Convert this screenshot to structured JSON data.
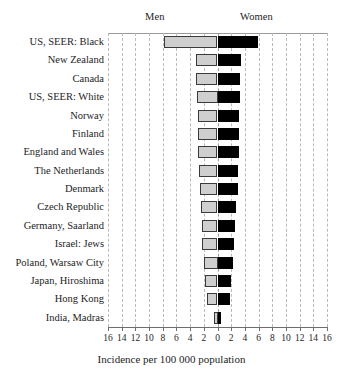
{
  "chart_data": {
    "type": "bar",
    "orientation": "horizontal",
    "style": "bidirectional-paired-bar",
    "title": "",
    "xlabel": "Incidence per 100 000 population",
    "ylabel": "",
    "xlim": [
      -16,
      16
    ],
    "xtick_step": 2,
    "xticks": [
      16,
      14,
      12,
      10,
      8,
      6,
      4,
      2,
      0,
      2,
      4,
      6,
      8,
      10,
      12,
      14,
      16
    ],
    "grid": true,
    "legend_position": "top",
    "categories": [
      "US, SEER: Black",
      "New Zealand",
      "Canada",
      "US, SEER: White",
      "Norway",
      "Finland",
      "England and Wales",
      "The Netherlands",
      "Denmark",
      "Czech Republic",
      "Germany, Saarland",
      "Israel: Jews",
      "Poland, Warsaw City",
      "Japan, Hiroshima",
      "Hong Kong",
      "India, Madras"
    ],
    "series": [
      {
        "name": "Men",
        "side": "left",
        "color": "#cfcfcf",
        "values": [
          7.8,
          3.2,
          3.1,
          3.0,
          2.9,
          2.9,
          2.8,
          2.7,
          2.6,
          2.4,
          2.3,
          2.2,
          2.0,
          1.8,
          1.6,
          0.5
        ]
      },
      {
        "name": "Women",
        "side": "right",
        "color": "#000000",
        "values": [
          5.9,
          3.4,
          3.3,
          3.3,
          3.2,
          3.2,
          3.1,
          3.0,
          3.0,
          2.7,
          2.5,
          2.4,
          2.2,
          2.0,
          1.8,
          0.5
        ]
      }
    ]
  },
  "labels": {
    "men": "Men",
    "women": "Women",
    "axis_title": "Incidence per 100 000 population"
  }
}
